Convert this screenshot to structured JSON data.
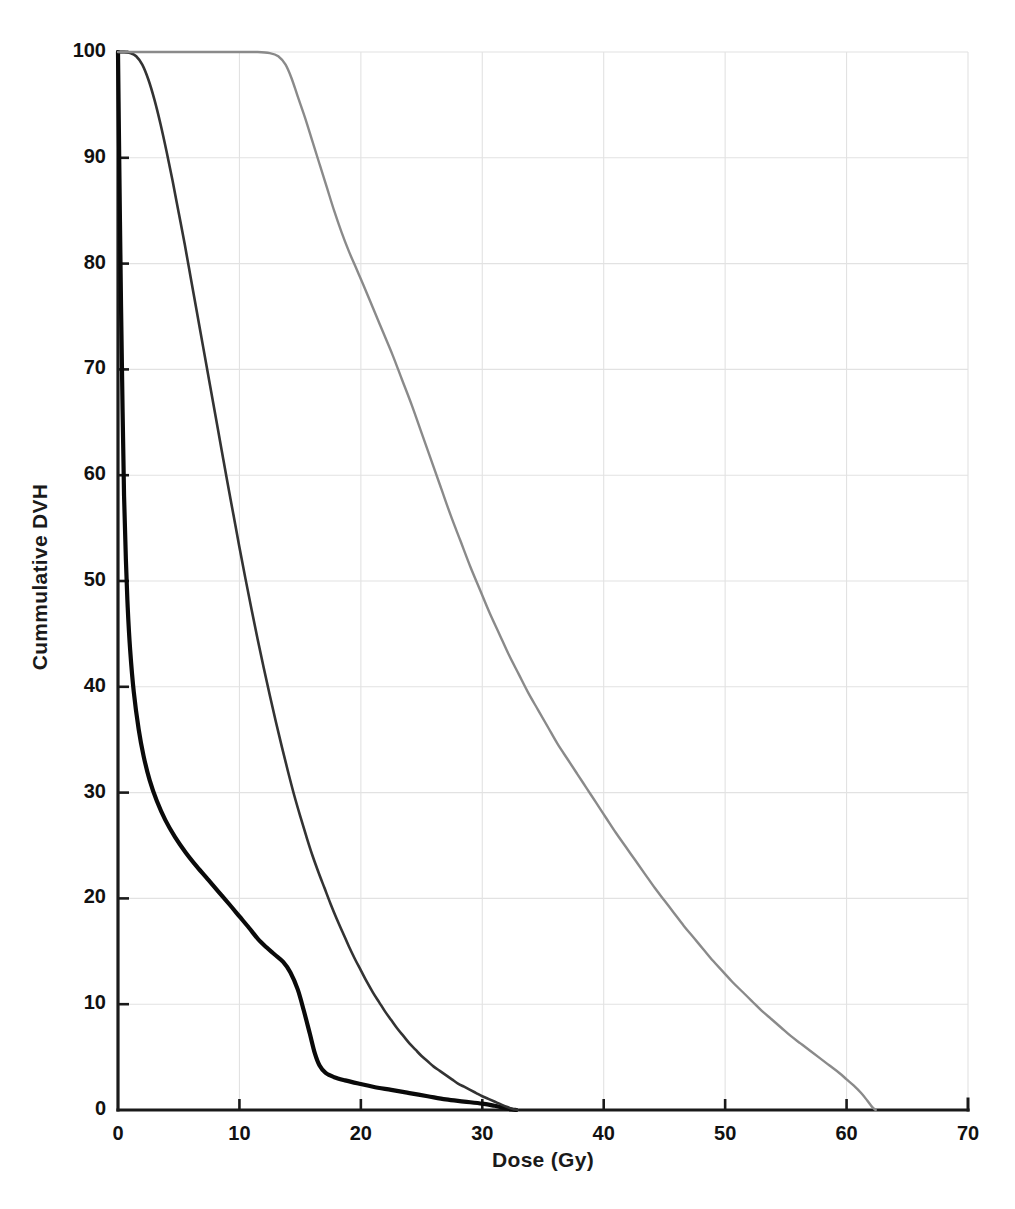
{
  "chart_data": {
    "type": "line",
    "title": "",
    "xlabel": "Dose (Gy)",
    "ylabel": "Cummulative DVH",
    "xlim": [
      0,
      70
    ],
    "ylim": [
      0,
      100
    ],
    "xticks": [
      0,
      10,
      20,
      30,
      40,
      50,
      60,
      70
    ],
    "xtick_labels": [
      "0",
      "10",
      "20",
      "30",
      "40",
      "50",
      "60",
      "70"
    ],
    "yticks": [
      0,
      10,
      20,
      30,
      40,
      50,
      60,
      70,
      80,
      90,
      100
    ],
    "ytick_labels": [
      "0",
      "10",
      "20",
      "30",
      "40",
      "50",
      "60",
      "70",
      "80",
      "90",
      "100"
    ],
    "grid": true,
    "grid_color": "#e2e2e2",
    "legend": "none",
    "axis_color": "#1a1a1a",
    "background": "#ffffff",
    "series": [
      {
        "name": "curve-bold-black",
        "style": "solid",
        "color": "#0a0a0a",
        "width": 4.2,
        "points": [
          [
            0.0,
            100.0
          ],
          [
            0.12,
            88.0
          ],
          [
            0.25,
            76.0
          ],
          [
            0.38,
            66.0
          ],
          [
            0.5,
            58.0
          ],
          [
            0.65,
            52.0
          ],
          [
            0.8,
            47.5
          ],
          [
            1.0,
            43.5
          ],
          [
            1.3,
            39.5
          ],
          [
            1.7,
            36.0
          ],
          [
            2.1,
            33.5
          ],
          [
            2.6,
            31.2
          ],
          [
            3.2,
            29.2
          ],
          [
            3.9,
            27.4
          ],
          [
            4.7,
            25.8
          ],
          [
            5.6,
            24.3
          ],
          [
            6.5,
            23.0
          ],
          [
            7.4,
            21.8
          ],
          [
            8.3,
            20.6
          ],
          [
            9.2,
            19.4
          ],
          [
            10.0,
            18.3
          ],
          [
            10.8,
            17.2
          ],
          [
            11.5,
            16.2
          ],
          [
            12.2,
            15.4
          ],
          [
            12.9,
            14.7
          ],
          [
            13.6,
            14.0
          ],
          [
            14.2,
            13.0
          ],
          [
            14.8,
            11.4
          ],
          [
            15.3,
            9.4
          ],
          [
            15.8,
            7.2
          ],
          [
            16.2,
            5.4
          ],
          [
            16.6,
            4.2
          ],
          [
            17.1,
            3.5
          ],
          [
            17.8,
            3.1
          ],
          [
            18.7,
            2.8
          ],
          [
            19.8,
            2.5
          ],
          [
            21.0,
            2.2
          ],
          [
            22.5,
            1.9
          ],
          [
            24.0,
            1.6
          ],
          [
            25.5,
            1.3
          ],
          [
            27.0,
            1.0
          ],
          [
            28.5,
            0.8
          ],
          [
            30.0,
            0.6
          ],
          [
            31.0,
            0.4
          ],
          [
            31.8,
            0.2
          ],
          [
            32.4,
            0.05
          ],
          [
            32.8,
            0.0
          ]
        ]
      },
      {
        "name": "curve-medium-dark",
        "style": "solid",
        "color": "#333333",
        "width": 2.6,
        "points": [
          [
            0.0,
            100.0
          ],
          [
            0.5,
            100.0
          ],
          [
            1.0,
            99.9
          ],
          [
            1.5,
            99.6
          ],
          [
            2.0,
            98.8
          ],
          [
            2.5,
            97.4
          ],
          [
            3.0,
            95.5
          ],
          [
            3.5,
            93.2
          ],
          [
            4.0,
            90.6
          ],
          [
            4.5,
            87.8
          ],
          [
            5.0,
            84.8
          ],
          [
            5.5,
            81.8
          ],
          [
            6.0,
            78.6
          ],
          [
            6.5,
            75.4
          ],
          [
            7.0,
            72.2
          ],
          [
            7.5,
            69.0
          ],
          [
            8.0,
            65.8
          ],
          [
            8.5,
            62.6
          ],
          [
            9.0,
            59.4
          ],
          [
            9.5,
            56.3
          ],
          [
            10.0,
            53.2
          ],
          [
            10.5,
            50.2
          ],
          [
            11.0,
            47.3
          ],
          [
            11.5,
            44.5
          ],
          [
            12.0,
            41.8
          ],
          [
            12.5,
            39.2
          ],
          [
            13.0,
            36.7
          ],
          [
            13.5,
            34.3
          ],
          [
            14.0,
            32.0
          ],
          [
            14.5,
            29.8
          ],
          [
            15.0,
            27.8
          ],
          [
            15.5,
            25.9
          ],
          [
            16.0,
            24.1
          ],
          [
            16.5,
            22.5
          ],
          [
            17.0,
            21.0
          ],
          [
            17.5,
            19.5
          ],
          [
            18.0,
            18.1
          ],
          [
            18.5,
            16.8
          ],
          [
            19.0,
            15.5
          ],
          [
            19.5,
            14.3
          ],
          [
            20.0,
            13.2
          ],
          [
            20.5,
            12.1
          ],
          [
            21.0,
            11.1
          ],
          [
            21.5,
            10.2
          ],
          [
            22.0,
            9.3
          ],
          [
            22.5,
            8.5
          ],
          [
            23.0,
            7.7
          ],
          [
            23.5,
            7.0
          ],
          [
            24.0,
            6.3
          ],
          [
            24.5,
            5.7
          ],
          [
            25.0,
            5.1
          ],
          [
            25.5,
            4.6
          ],
          [
            26.0,
            4.1
          ],
          [
            26.5,
            3.7
          ],
          [
            27.0,
            3.3
          ],
          [
            27.5,
            2.9
          ],
          [
            28.0,
            2.5
          ],
          [
            28.5,
            2.2
          ],
          [
            29.0,
            1.9
          ],
          [
            29.5,
            1.6
          ],
          [
            30.0,
            1.3
          ],
          [
            30.5,
            1.05
          ],
          [
            31.0,
            0.8
          ],
          [
            31.5,
            0.55
          ],
          [
            32.0,
            0.3
          ],
          [
            32.5,
            0.1
          ],
          [
            32.9,
            0.0
          ]
        ]
      },
      {
        "name": "curve-light-gray",
        "style": "solid",
        "color": "#8a8a8a",
        "width": 2.4,
        "points": [
          [
            0.0,
            100.0
          ],
          [
            2.0,
            100.0
          ],
          [
            4.0,
            100.0
          ],
          [
            6.0,
            100.0
          ],
          [
            8.0,
            100.0
          ],
          [
            10.0,
            100.0
          ],
          [
            11.5,
            100.0
          ],
          [
            12.5,
            99.9
          ],
          [
            13.2,
            99.6
          ],
          [
            13.8,
            98.8
          ],
          [
            14.3,
            97.5
          ],
          [
            14.8,
            95.8
          ],
          [
            15.4,
            93.8
          ],
          [
            16.0,
            91.6
          ],
          [
            16.6,
            89.4
          ],
          [
            17.2,
            87.2
          ],
          [
            17.8,
            85.0
          ],
          [
            18.4,
            83.0
          ],
          [
            19.0,
            81.2
          ],
          [
            19.6,
            79.6
          ],
          [
            20.2,
            78.0
          ],
          [
            21.0,
            75.8
          ],
          [
            21.8,
            73.6
          ],
          [
            22.6,
            71.4
          ],
          [
            23.4,
            69.0
          ],
          [
            24.2,
            66.6
          ],
          [
            25.0,
            64.0
          ],
          [
            25.8,
            61.4
          ],
          [
            26.6,
            58.8
          ],
          [
            27.4,
            56.2
          ],
          [
            28.2,
            53.8
          ],
          [
            29.0,
            51.4
          ],
          [
            29.8,
            49.2
          ],
          [
            30.6,
            47.0
          ],
          [
            31.4,
            45.0
          ],
          [
            32.2,
            43.0
          ],
          [
            33.0,
            41.2
          ],
          [
            33.8,
            39.4
          ],
          [
            34.6,
            37.8
          ],
          [
            35.4,
            36.2
          ],
          [
            36.2,
            34.6
          ],
          [
            37.0,
            33.2
          ],
          [
            37.8,
            31.8
          ],
          [
            38.6,
            30.4
          ],
          [
            39.4,
            29.0
          ],
          [
            40.2,
            27.6
          ],
          [
            41.0,
            26.2
          ],
          [
            41.8,
            24.9
          ],
          [
            42.6,
            23.6
          ],
          [
            43.4,
            22.3
          ],
          [
            44.2,
            21.0
          ],
          [
            45.0,
            19.8
          ],
          [
            45.8,
            18.6
          ],
          [
            46.6,
            17.4
          ],
          [
            47.4,
            16.3
          ],
          [
            48.2,
            15.2
          ],
          [
            49.0,
            14.1
          ],
          [
            49.8,
            13.1
          ],
          [
            50.6,
            12.1
          ],
          [
            51.4,
            11.2
          ],
          [
            52.2,
            10.3
          ],
          [
            53.0,
            9.4
          ],
          [
            53.8,
            8.6
          ],
          [
            54.6,
            7.8
          ],
          [
            55.4,
            7.0
          ],
          [
            56.2,
            6.3
          ],
          [
            57.0,
            5.6
          ],
          [
            57.8,
            4.9
          ],
          [
            58.6,
            4.2
          ],
          [
            59.4,
            3.5
          ],
          [
            60.0,
            2.9
          ],
          [
            60.6,
            2.3
          ],
          [
            61.2,
            1.6
          ],
          [
            61.7,
            0.9
          ],
          [
            62.1,
            0.3
          ],
          [
            62.4,
            0.0
          ]
        ]
      }
    ]
  }
}
